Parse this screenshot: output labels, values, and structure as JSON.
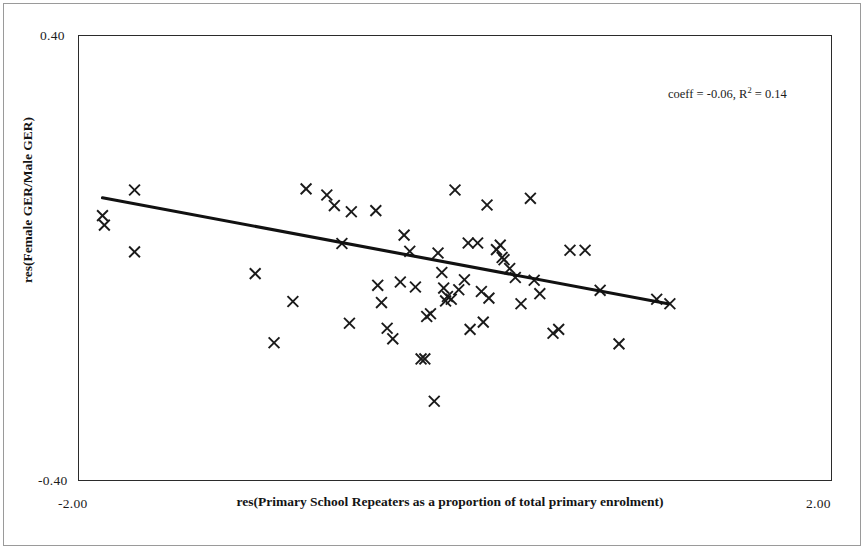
{
  "figure": {
    "width": 865,
    "height": 550,
    "background": "#ffffff",
    "border_color": "#9a9a9a"
  },
  "axes": {
    "frame_color": "#2b2b2b",
    "y_title": "res(Female GER/Male GER)",
    "x_title": "res(Primary School Repeaters as a proportion of total primary enrolment)",
    "y_tick_max": "0.40",
    "y_tick_min": "-0.40",
    "x_tick_min": "-2.00",
    "x_tick_max": "2.00"
  },
  "annotation": {
    "prefix": "coeff = -0.06, R",
    "exponent": "2",
    "suffix": " = 0.14",
    "full_text": "coeff = -0.06, R2 = 0.14"
  },
  "chart_data": {
    "type": "scatter",
    "title": "",
    "subtitle": "",
    "xlabel": "res(Primary School Repeaters as a proportion of total primary enrolment)",
    "ylabel": "res(Female GER/Male GER)",
    "xlim": [
      -2.0,
      2.0
    ],
    "ylim": [
      -0.4,
      0.4
    ],
    "xticks": [
      -2.0,
      2.0
    ],
    "yticks": [
      -0.4,
      0.4
    ],
    "xtick_labels": [
      "-2.00",
      "2.00"
    ],
    "ytick_labels": [
      "-0.40",
      "0.40"
    ],
    "grid": false,
    "legend": false,
    "marker": "x",
    "marker_color": "#1a1a1a",
    "annotations": [
      {
        "text": "coeff = -0.06, R2 = 0.14",
        "x": 1.36,
        "y": 0.31
      }
    ],
    "trend_line": {
      "type": "linear",
      "slope": -0.06,
      "r_squared": 0.14,
      "color": "#111111",
      "x_start": -1.87,
      "y_start": 0.108,
      "x_end": 1.13,
      "y_end": -0.082
    },
    "n_points": 61,
    "points": [
      {
        "x": -1.7,
        "y": 0.122
      },
      {
        "x": -1.87,
        "y": 0.076
      },
      {
        "x": -1.86,
        "y": 0.059
      },
      {
        "x": -1.7,
        "y": 0.011
      },
      {
        "x": -1.06,
        "y": -0.028
      },
      {
        "x": -0.96,
        "y": -0.152
      },
      {
        "x": -0.86,
        "y": -0.078
      },
      {
        "x": -0.79,
        "y": 0.124
      },
      {
        "x": -0.68,
        "y": 0.113
      },
      {
        "x": -0.64,
        "y": 0.094
      },
      {
        "x": -0.6,
        "y": 0.026
      },
      {
        "x": -0.56,
        "y": -0.117
      },
      {
        "x": -0.55,
        "y": 0.083
      },
      {
        "x": -0.42,
        "y": 0.085
      },
      {
        "x": -0.41,
        "y": -0.049
      },
      {
        "x": -0.39,
        "y": -0.08
      },
      {
        "x": -0.36,
        "y": -0.126
      },
      {
        "x": -0.33,
        "y": -0.145
      },
      {
        "x": -0.29,
        "y": -0.043
      },
      {
        "x": -0.27,
        "y": 0.041
      },
      {
        "x": -0.24,
        "y": 0.012
      },
      {
        "x": -0.21,
        "y": -0.052
      },
      {
        "x": -0.18,
        "y": -0.181
      },
      {
        "x": -0.16,
        "y": -0.181
      },
      {
        "x": -0.15,
        "y": -0.105
      },
      {
        "x": -0.13,
        "y": -0.1
      },
      {
        "x": -0.11,
        "y": -0.257
      },
      {
        "x": -0.09,
        "y": 0.009
      },
      {
        "x": -0.07,
        "y": -0.026
      },
      {
        "x": -0.06,
        "y": -0.054
      },
      {
        "x": -0.05,
        "y": -0.077
      },
      {
        "x": -0.04,
        "y": -0.069
      },
      {
        "x": -0.02,
        "y": -0.074
      },
      {
        "x": 0.0,
        "y": 0.122
      },
      {
        "x": 0.02,
        "y": -0.057
      },
      {
        "x": 0.05,
        "y": -0.039
      },
      {
        "x": 0.07,
        "y": 0.027
      },
      {
        "x": 0.08,
        "y": -0.128
      },
      {
        "x": 0.12,
        "y": 0.027
      },
      {
        "x": 0.14,
        "y": -0.06
      },
      {
        "x": 0.15,
        "y": -0.115
      },
      {
        "x": 0.17,
        "y": 0.095
      },
      {
        "x": 0.18,
        "y": -0.072
      },
      {
        "x": 0.22,
        "y": 0.015
      },
      {
        "x": 0.24,
        "y": 0.023
      },
      {
        "x": 0.25,
        "y": 0.001
      },
      {
        "x": 0.26,
        "y": -0.003
      },
      {
        "x": 0.29,
        "y": -0.019
      },
      {
        "x": 0.32,
        "y": -0.035
      },
      {
        "x": 0.35,
        "y": -0.082
      },
      {
        "x": 0.4,
        "y": 0.107
      },
      {
        "x": 0.42,
        "y": -0.04
      },
      {
        "x": 0.45,
        "y": -0.064
      },
      {
        "x": 0.52,
        "y": -0.135
      },
      {
        "x": 0.55,
        "y": -0.128
      },
      {
        "x": 0.61,
        "y": 0.014
      },
      {
        "x": 0.69,
        "y": 0.014
      },
      {
        "x": 0.77,
        "y": -0.058
      },
      {
        "x": 0.87,
        "y": -0.154
      },
      {
        "x": 1.07,
        "y": -0.074
      },
      {
        "x": 1.14,
        "y": -0.082
      }
    ]
  }
}
